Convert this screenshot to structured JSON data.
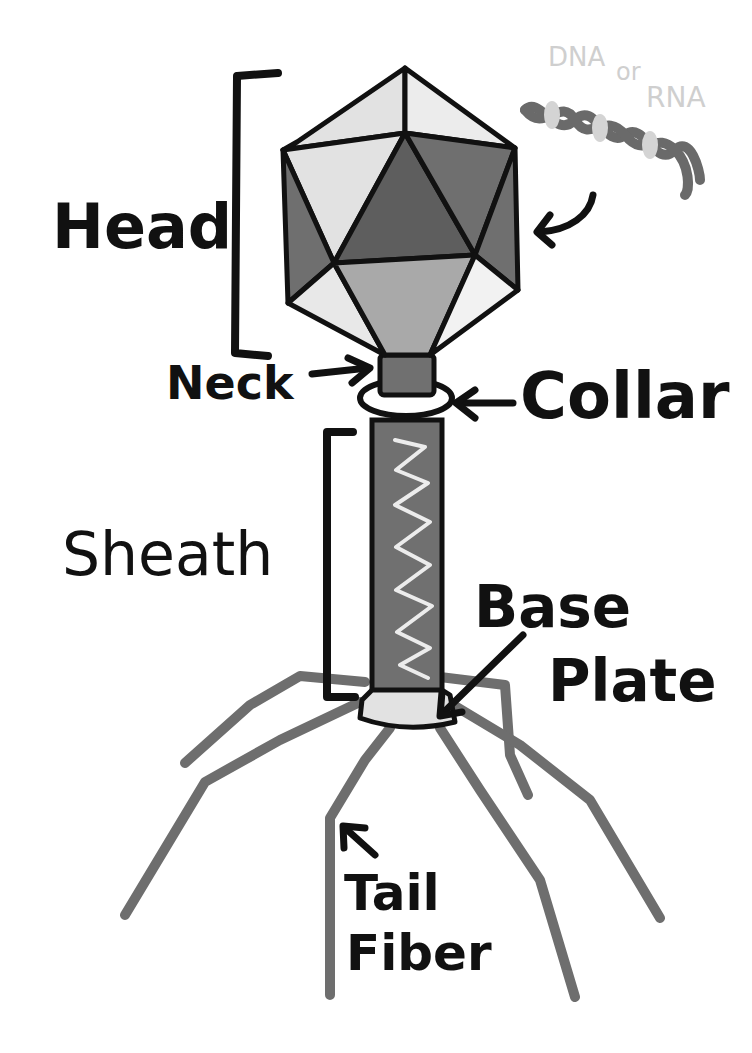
{
  "labels": {
    "head": "Head",
    "neck": "Neck",
    "collar": "Collar",
    "sheath": "Sheath",
    "base_plate_line1": "Base",
    "base_plate_line2": "Plate",
    "tail_fiber_line1": "Tail",
    "tail_fiber_line2": "Fiber",
    "dna": "DNA",
    "or": "or",
    "rna": "RNA"
  },
  "colors": {
    "outline": "#111111",
    "face_light": "#e2e2e2",
    "face_lighter": "#ececec",
    "face_mid": "#a9a9a9",
    "face_dark": "#6f6f6f",
    "face_darker": "#5e5e5e",
    "sheath": "#707070",
    "fiber": "#6e6e6e",
    "helix": "#6a6a6a",
    "helix_fill": "#d4d4d4",
    "label_light": "#cfcfcf"
  }
}
